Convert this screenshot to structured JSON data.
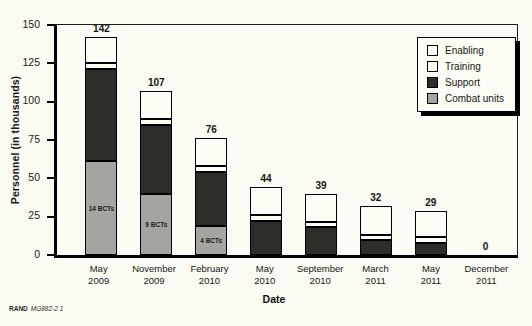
{
  "figure_note": {
    "brand": "RAND",
    "doc": "MG882-2.1"
  },
  "colors": {
    "background": "#fbfbf3",
    "support": "#2e2d2a",
    "combat": "#a5a4a0",
    "white_segment": "#fdfdf6",
    "axis": "#000000"
  },
  "chart_data": {
    "type": "bar",
    "stacked": true,
    "title": "",
    "xlabel": "Date",
    "ylabel": "Personnel (in thousands)",
    "ylim": [
      0,
      150
    ],
    "yticks": [
      0,
      25,
      50,
      75,
      100,
      125,
      150
    ],
    "grid": false,
    "legend_position": "top-right",
    "categories": [
      [
        "May",
        "2009"
      ],
      [
        "November",
        "2009"
      ],
      [
        "February",
        "2010"
      ],
      [
        "May",
        "2010"
      ],
      [
        "September",
        "2010"
      ],
      [
        "March",
        "2011"
      ],
      [
        "May",
        "2011"
      ],
      [
        "December",
        "2011"
      ]
    ],
    "series": [
      {
        "name": "Combat units",
        "color": "#a5a4a0",
        "values": [
          61,
          40,
          19,
          0,
          0,
          0,
          0,
          0
        ]
      },
      {
        "name": "Support",
        "color": "#2e2d2a",
        "values": [
          60,
          45,
          35,
          22,
          18,
          10,
          8,
          0
        ]
      },
      {
        "name": "Training",
        "color": "#fdfdf6",
        "values": [
          4,
          4,
          4,
          4,
          3,
          3,
          4,
          0
        ]
      },
      {
        "name": "Enabling",
        "color": "#fdfdf6",
        "values": [
          17,
          18,
          18,
          18,
          18,
          19,
          17,
          0
        ]
      }
    ],
    "totals": [
      142,
      107,
      76,
      44,
      39,
      32,
      29,
      0
    ],
    "bar_annotations": [
      "14 BCTs",
      "9 BCTs",
      "4 BCTs",
      "",
      "",
      "",
      "",
      ""
    ],
    "legend_entries": [
      {
        "label": "Enabling",
        "color": "#fdfdf6"
      },
      {
        "label": "Training",
        "color": "#fdfdf6"
      },
      {
        "label": "Support",
        "color": "#2e2d2a"
      },
      {
        "label": "Combat units",
        "color": "#a5a4a0"
      }
    ]
  }
}
